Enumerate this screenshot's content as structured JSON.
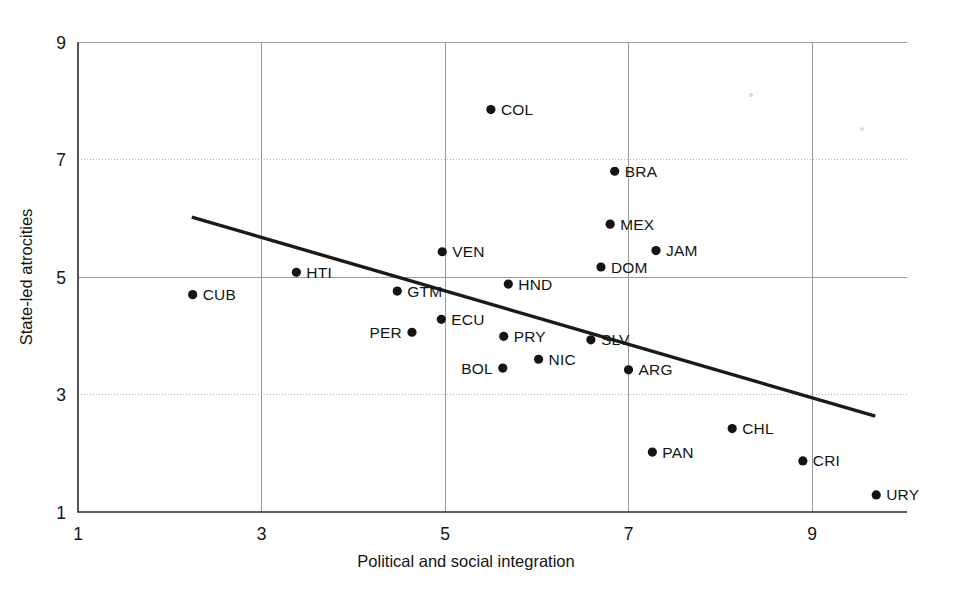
{
  "chart_data": {
    "type": "scatter",
    "title": "",
    "xlabel": "Political and social integration",
    "ylabel": "State-led atrocities",
    "xlim": [
      1,
      9.8
    ],
    "ylim": [
      1,
      9
    ],
    "xticks": [
      1,
      3,
      5,
      7,
      9
    ],
    "yticks": [
      1,
      3,
      5,
      7,
      9
    ],
    "xtick_labels": [
      "1",
      "3",
      "5",
      "7",
      "9"
    ],
    "ytick_labels": [
      "1",
      "3",
      "5",
      "7",
      "9"
    ],
    "grid": true,
    "legend": "none",
    "point_color": "#141414",
    "line_color": "#1a1a1a",
    "grid_color": "#9a9a9a",
    "axis_color": "#2b2b2b",
    "points": [
      {
        "label": "COL",
        "x": 5.5,
        "y": 7.85,
        "label_side": "right"
      },
      {
        "label": "BRA",
        "x": 6.85,
        "y": 6.8,
        "label_side": "right"
      },
      {
        "label": "MEX",
        "x": 6.8,
        "y": 5.9,
        "label_side": "right"
      },
      {
        "label": "JAM",
        "x": 7.3,
        "y": 5.45,
        "label_side": "right"
      },
      {
        "label": "DOM",
        "x": 6.7,
        "y": 5.17,
        "label_side": "right"
      },
      {
        "label": "VEN",
        "x": 4.97,
        "y": 5.43,
        "label_side": "right"
      },
      {
        "label": "HTI",
        "x": 3.38,
        "y": 5.08,
        "label_side": "right"
      },
      {
        "label": "CUB",
        "x": 2.25,
        "y": 4.7,
        "label_side": "right"
      },
      {
        "label": "HND",
        "x": 5.69,
        "y": 4.88,
        "label_side": "right"
      },
      {
        "label": "GTM",
        "x": 4.48,
        "y": 4.76,
        "label_side": "right"
      },
      {
        "label": "ECU",
        "x": 4.96,
        "y": 4.28,
        "label_side": "right"
      },
      {
        "label": "PER",
        "x": 4.64,
        "y": 4.06,
        "label_side": "left"
      },
      {
        "label": "PRY",
        "x": 5.64,
        "y": 3.99,
        "label_side": "right"
      },
      {
        "label": "SLV",
        "x": 6.59,
        "y": 3.93,
        "label_side": "right"
      },
      {
        "label": "NIC",
        "x": 6.02,
        "y": 3.6,
        "label_side": "right"
      },
      {
        "label": "BOL",
        "x": 5.63,
        "y": 3.45,
        "label_side": "left"
      },
      {
        "label": "ARG",
        "x": 7.0,
        "y": 3.42,
        "label_side": "right"
      },
      {
        "label": "CHL",
        "x": 8.13,
        "y": 2.42,
        "label_side": "right"
      },
      {
        "label": "PAN",
        "x": 7.26,
        "y": 2.02,
        "label_side": "right"
      },
      {
        "label": "CRI",
        "x": 8.9,
        "y": 1.87,
        "label_side": "right"
      },
      {
        "label": "URY",
        "x": 9.7,
        "y": 1.29,
        "label_side": "right"
      }
    ],
    "trend_line": {
      "x1": 2.24,
      "y1": 6.02,
      "x2": 9.69,
      "y2": 2.63
    }
  },
  "figure": {
    "axis_y_title": "State-led atrocities",
    "axis_x_title": "Political and social integration"
  }
}
